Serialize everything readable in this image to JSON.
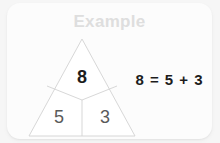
{
  "card": {
    "title": "Example",
    "background_color": "#fcfcfc",
    "title_color": "#dedede",
    "page_background_color": "#f6f6f6"
  },
  "diagram": {
    "type": "number-bond-triangle",
    "name": "number-triangle",
    "outline_color": "#cfcfcf",
    "whole": {
      "label": "8",
      "color": "#1c1c1c",
      "position": "top"
    },
    "parts": [
      {
        "label": "5",
        "color": "#5a5a5a",
        "position": "bottom-left"
      },
      {
        "label": "3",
        "color": "#5a5a5a",
        "position": "bottom-right"
      }
    ]
  },
  "equation": {
    "text": "8 = 5 + 3",
    "whole": "8",
    "equals": "=",
    "part_a": "5",
    "operator": "+",
    "part_b": "3",
    "color": "#1c1c1c"
  }
}
